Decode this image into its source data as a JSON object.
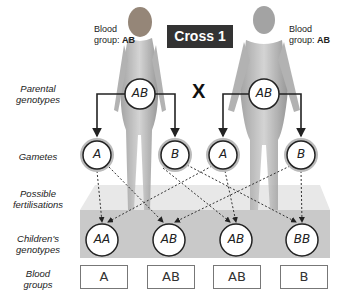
{
  "title": "Cross 1",
  "cross_symbol": "X",
  "parents": {
    "mother": {
      "label_prefix": "Blood",
      "label_line2": "group: ",
      "blood_group": "AB",
      "genotype": "AB"
    },
    "father": {
      "label_prefix": "Blood",
      "label_line2": "group: ",
      "blood_group": "AB",
      "genotype": "AB"
    }
  },
  "row_labels": {
    "parental_genotypes": [
      "Parental",
      "genotypes"
    ],
    "gametes": [
      "Gametes"
    ],
    "fertilisations": [
      "Possible",
      "fertilisations"
    ],
    "children_genotypes": [
      "Children's",
      "genotypes"
    ],
    "blood_groups": [
      "Blood",
      "groups"
    ]
  },
  "gametes": [
    "A",
    "B",
    "A",
    "B"
  ],
  "children_genotypes": [
    "AA",
    "AB",
    "AB",
    "BB"
  ],
  "children_blood_groups": [
    "A",
    "AB",
    "AB",
    "B"
  ],
  "colors": {
    "title_bg": "#333333",
    "platform_top": "#e6e6e6",
    "platform_band": "#c8c8c8",
    "circle_ring": "#aaaaaa"
  }
}
